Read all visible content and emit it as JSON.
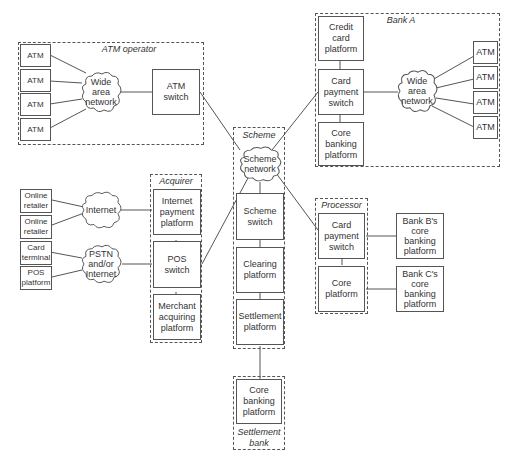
{
  "groups": {
    "atm_operator": "ATM operator",
    "bank_a": "Bank A",
    "scheme": "Scheme",
    "acquirer": "Acquirer",
    "processor": "Processor",
    "settlement_bank": "Settlement\nbank"
  },
  "atm_operator": {
    "atms": [
      "ATM",
      "ATM",
      "ATM",
      "ATM"
    ],
    "network": "Wide\narea\nnetwork",
    "switch": "ATM\nswitch"
  },
  "bank_a": {
    "credit_card": "Credit\ncard\nplatform",
    "card_switch": "Card\npayment\nswitch",
    "core_banking": "Core\nbanking\nplatform",
    "network": "Wide\narea\nnetwork",
    "atms": [
      "ATM",
      "ATM",
      "ATM",
      "ATM"
    ]
  },
  "scheme": {
    "network": "Scheme\nnetwork",
    "switch": "Scheme\nswitch",
    "clearing": "Clearing\nplatform",
    "settlement": "Settlement\nplatform"
  },
  "settlement_bank": {
    "core_banking": "Core\nbanking\nplatform"
  },
  "acquirer": {
    "internet_payment": "Internet\npayment\nplatform",
    "pos_switch": "POS\nswitch",
    "merchant_acquiring": "Merchant\nacquiring\nplatform"
  },
  "merchants": {
    "online_retailer_1": "Online\nretailer",
    "online_retailer_2": "Online\nretailer",
    "card_terminal": "Card\nterminal",
    "pos_platform": "POS\nplatform",
    "internet_cloud": "Internet",
    "pstn_cloud": "PSTN\nand/or\nInternet"
  },
  "processor": {
    "card_switch": "Card\npayment\nswitch",
    "core_platform": "Core\nplatform"
  },
  "external_banks": {
    "bank_b": "Bank B's\ncore\nbanking\nplatform",
    "bank_c": "Bank C's\ncore\nbanking\nplatform"
  }
}
